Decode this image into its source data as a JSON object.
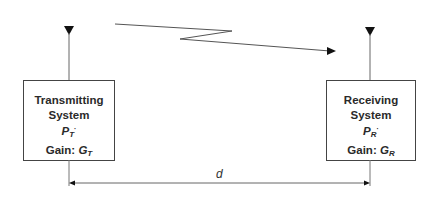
{
  "diagram": {
    "title": "",
    "transmitter": {
      "line1": "Transmitting",
      "line2": "System",
      "power_symbol": "P",
      "power_sub": "T",
      "power_suffix": "·",
      "gain_label": "Gain: ",
      "gain_symbol": "G",
      "gain_sub": "T"
    },
    "receiver": {
      "line1": "Receiving",
      "line2": "System",
      "power_symbol": "P",
      "power_sub": "R",
      "power_suffix": "·",
      "gain_label": "Gain: ",
      "gain_symbol": "G",
      "gain_sub": "R"
    },
    "distance_label": "d",
    "icons": {
      "tx_antenna": "antenna-icon",
      "rx_antenna": "antenna-icon",
      "signal": "lightning-zigzag-arrow"
    },
    "colors": {
      "line": "#555555",
      "fill": "#111111",
      "box_border": "#444444"
    }
  }
}
